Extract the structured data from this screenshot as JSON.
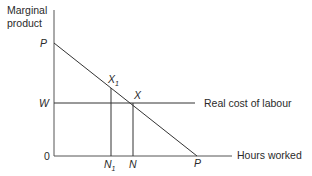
{
  "diagram": {
    "y_axis_label_line1": "Marginal",
    "y_axis_label_line2": "product",
    "x_axis_label": "Hours worked",
    "origin_label": "0",
    "mp_curve_top_label": "P",
    "mp_curve_bottom_label": "P",
    "wage_label": "W",
    "wage_line_label": "Real cost of labour",
    "point_x1_label": "X",
    "point_x1_sub": "1",
    "point_x_label": "X",
    "n1_label": "N",
    "n1_sub": "1",
    "n_label": "N"
  }
}
